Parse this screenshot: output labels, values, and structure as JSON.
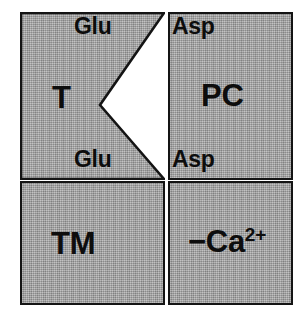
{
  "figure": {
    "background_color": "#ffffff",
    "panel_fill_color": "#a9a9a9",
    "border_color": "#141414",
    "text_color": "#0d0d0d"
  },
  "panels": [
    {
      "id": "panel-t",
      "label": "T",
      "position": "top-left",
      "shape": "rectangle-with-right-v-notch",
      "notch": {
        "apex_x_fraction": 0.55,
        "apex_y_fraction": 0.55
      }
    },
    {
      "id": "panel-pc",
      "label": "PC",
      "position": "top-right",
      "shape": "rectangle"
    },
    {
      "id": "panel-tm",
      "label": "TM",
      "position": "bottom-left",
      "shape": "rectangle"
    },
    {
      "id": "panel-ca",
      "label_prefix": "−Ca",
      "label_superscript": "2+",
      "position": "bottom-right",
      "shape": "rectangle"
    }
  ],
  "residue_labels": {
    "glu_top": "Glu",
    "glu_bottom": "Glu",
    "asp_top": "Asp",
    "asp_bottom": "Asp"
  }
}
